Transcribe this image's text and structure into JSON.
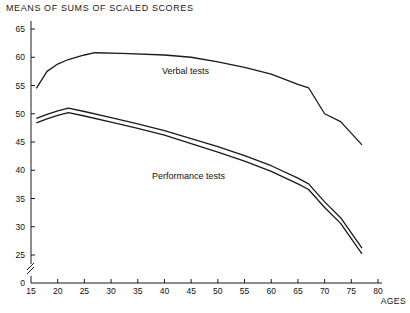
{
  "chart_data": {
    "type": "line",
    "title": "MEANS OF SUMS OF SCALED SCORES",
    "xlabel": "AGES",
    "ylabel": "",
    "xlim": [
      15,
      80
    ],
    "ylim": [
      0,
      67
    ],
    "y_axis_break": true,
    "y_break_between": [
      0,
      25
    ],
    "grid": false,
    "legend": "inline-annotations",
    "xticks": [
      15,
      20,
      25,
      30,
      35,
      40,
      45,
      50,
      55,
      60,
      65,
      70,
      75,
      80
    ],
    "yticks": [
      0,
      25,
      30,
      35,
      40,
      45,
      50,
      55,
      60,
      65
    ],
    "series": [
      {
        "name": "Verbal tests",
        "style": "single-line",
        "x": [
          16,
          18,
          20,
          22,
          25,
          27,
          32,
          40,
          45,
          50,
          55,
          60,
          65,
          67,
          70,
          73,
          77
        ],
        "values": [
          54.5,
          57.5,
          58.8,
          59.6,
          60.4,
          60.8,
          60.7,
          60.4,
          60.0,
          59.2,
          58.2,
          57.0,
          55.2,
          54.6,
          50.0,
          48.6,
          44.5
        ]
      },
      {
        "name": "Performance tests",
        "style": "double-line",
        "x": [
          16,
          18,
          20,
          22,
          25,
          30,
          35,
          40,
          45,
          50,
          55,
          60,
          65,
          67,
          70,
          73,
          77
        ],
        "values": [
          49.2,
          49.9,
          50.5,
          51.0,
          50.4,
          49.3,
          48.2,
          47.0,
          45.6,
          44.2,
          42.6,
          40.8,
          38.6,
          37.6,
          34.4,
          31.6,
          26.2
        ],
        "values_lower": [
          48.4,
          49.1,
          49.7,
          50.2,
          49.6,
          48.5,
          47.4,
          46.2,
          44.7,
          43.2,
          41.6,
          39.8,
          37.6,
          36.6,
          33.4,
          30.6,
          25.2
        ]
      }
    ],
    "annotations": [
      {
        "text": "Verbal tests",
        "x": 41,
        "y": 57.2
      },
      {
        "text": "Performance tests",
        "x": 39,
        "y": 39.0
      }
    ],
    "colors": {
      "line": "#1a1a1a",
      "axis": "#1a1a1a",
      "background": "#ffffff"
    }
  }
}
